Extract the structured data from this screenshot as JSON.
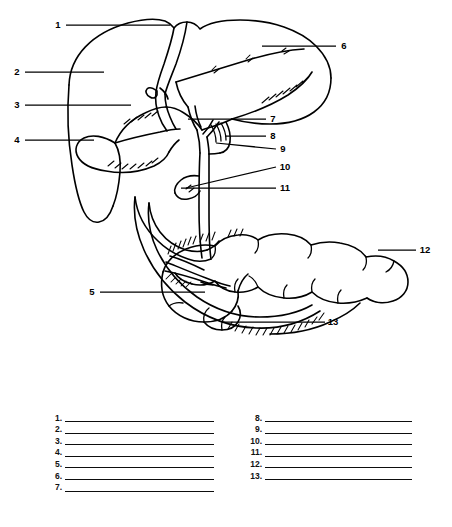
{
  "figure": {
    "line_color": "#000000",
    "background_color": "#ffffff",
    "callouts": [
      {
        "id": "1",
        "text": "1",
        "x": 58,
        "y": 28
      },
      {
        "id": "2",
        "text": "2",
        "x": 17,
        "y": 75
      },
      {
        "id": "3",
        "text": "3",
        "x": 17,
        "y": 108
      },
      {
        "id": "4",
        "text": "4",
        "x": 17,
        "y": 143
      },
      {
        "id": "5",
        "text": "5",
        "x": 92,
        "y": 295
      },
      {
        "id": "6",
        "text": "6",
        "x": 344,
        "y": 49
      },
      {
        "id": "7",
        "text": "7",
        "x": 273,
        "y": 122
      },
      {
        "id": "8",
        "text": "8",
        "x": 273,
        "y": 139
      },
      {
        "id": "9",
        "text": "9",
        "x": 283,
        "y": 152
      },
      {
        "id": "10",
        "text": "10",
        "x": 283,
        "y": 170
      },
      {
        "id": "11",
        "text": "11",
        "x": 283,
        "y": 191
      },
      {
        "id": "12",
        "text": "12",
        "x": 424,
        "y": 253
      },
      {
        "id": "13",
        "text": "13",
        "x": 332,
        "y": 325
      }
    ]
  },
  "answers": {
    "left_column": [
      "1.",
      "2.",
      "3.",
      "4.",
      "5.",
      "6.",
      "7."
    ],
    "right_column": [
      "8.",
      "9.",
      "10.",
      "11.",
      "12.",
      "13."
    ]
  }
}
